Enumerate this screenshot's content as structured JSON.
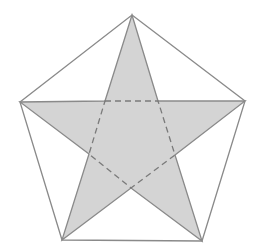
{
  "diagram": {
    "title": "",
    "colors": {
      "background": "#ffffff",
      "star_fill": "#d4d4d4",
      "line": "#8a8a8a",
      "dashed_line": "#7a7a7a"
    },
    "outer_pentagon": {
      "vertices": [
        [
          132,
          15
        ],
        [
          245,
          101
        ],
        [
          202,
          241
        ],
        [
          62,
          240
        ],
        [
          20,
          102
        ]
      ]
    },
    "star": {
      "points": [
        [
          132,
          15
        ],
        [
          158,
          101
        ],
        [
          245,
          101
        ],
        [
          175,
          155
        ],
        [
          202,
          241
        ],
        [
          131,
          188
        ],
        [
          62,
          240
        ],
        [
          89,
          154
        ],
        [
          20,
          102
        ],
        [
          105,
          101
        ]
      ]
    },
    "inner_pentagon": {
      "vertices": [
        [
          105,
          101
        ],
        [
          158,
          101
        ],
        [
          175,
          155
        ],
        [
          131,
          188
        ],
        [
          89,
          154
        ]
      ],
      "style": "dashed"
    }
  }
}
